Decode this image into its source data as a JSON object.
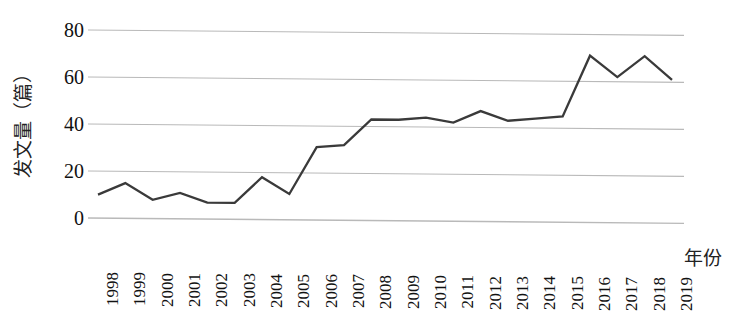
{
  "chart_data": {
    "type": "line",
    "title": "",
    "subtitle": "",
    "xlabel": "年份",
    "ylabel": "发文量（篇）",
    "categories": [
      "1998",
      "1999",
      "2000",
      "2001",
      "2002",
      "2003",
      "2004",
      "2005",
      "2006",
      "2007",
      "2008",
      "2009",
      "2010",
      "2011",
      "2012",
      "2013",
      "2014",
      "2015",
      "2016",
      "2017",
      "2018",
      "2019"
    ],
    "values": [
      10,
      15,
      8,
      11,
      7,
      7,
      18,
      11,
      31,
      32,
      43,
      43,
      44,
      42,
      47,
      43,
      44,
      45,
      71,
      62,
      71,
      61
    ],
    "series": [
      {
        "name": "发文量",
        "values": [
          10,
          15,
          8,
          11,
          7,
          7,
          18,
          11,
          31,
          32,
          43,
          43,
          44,
          42,
          47,
          43,
          44,
          45,
          71,
          62,
          71,
          61
        ]
      }
    ],
    "ylim": [
      0,
      80
    ],
    "yticks": [
      0,
      20,
      40,
      60,
      80
    ],
    "ytick_labels": [
      "0",
      "20",
      "40",
      "60",
      "80"
    ],
    "xlim": [
      "1998",
      "2019"
    ],
    "grid": true,
    "grid_axis": "y",
    "legend": false,
    "legend_position": "none",
    "markers": false,
    "colors": {
      "line": "#3a3a3a",
      "grid": "#b9b9b9",
      "text": "#111111",
      "background": "#ffffff"
    }
  }
}
